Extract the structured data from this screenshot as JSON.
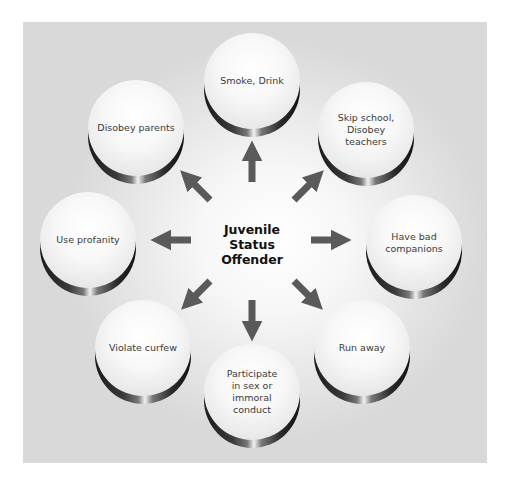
{
  "diagram": {
    "center": {
      "label": "Juvenile\nStatus\nOffender"
    },
    "nodes": [
      {
        "id": "smoke-drink",
        "label": "Smoke, Drink",
        "x": 204,
        "y": 33
      },
      {
        "id": "disobey-parents",
        "label": "Disobey parents",
        "x": 88,
        "y": 80
      },
      {
        "id": "skip-school",
        "label": "Skip school,\nDisobey teachers",
        "x": 318,
        "y": 82
      },
      {
        "id": "use-profanity",
        "label": "Use profanity",
        "x": 40,
        "y": 192
      },
      {
        "id": "bad-companions",
        "label": "Have bad\ncompanions",
        "x": 366,
        "y": 195
      },
      {
        "id": "violate-curfew",
        "label": "Violate curfew",
        "x": 95,
        "y": 300
      },
      {
        "id": "participate-sex",
        "label": "Participate\nin sex or\nimmoral\nconduct",
        "x": 204,
        "y": 344
      },
      {
        "id": "run-away",
        "label": "Run away",
        "x": 314,
        "y": 300
      }
    ],
    "colors": {
      "arrow": "#5a5a5a",
      "panel": "#e0e0e0",
      "center_text": "#111111"
    }
  }
}
